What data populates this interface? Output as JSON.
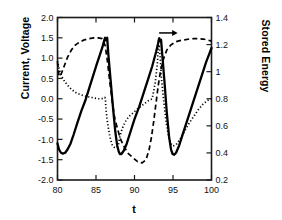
{
  "chart_data": {
    "type": "line",
    "title": "",
    "xlabel": "t",
    "ylabel": "Current, Voltage",
    "y2label": "Stored Energy",
    "xlim": [
      80,
      100
    ],
    "ylim": [
      -2.0,
      2.0
    ],
    "y2lim": [
      0.2,
      1.4
    ],
    "grid": false,
    "legend": "none",
    "xticks": [
      80,
      85,
      90,
      95,
      100
    ],
    "xtick_labels": [
      "80",
      "85",
      "90",
      "95",
      "100"
    ],
    "yticks": [
      -2.0,
      -1.5,
      -1.0,
      -0.5,
      0.0,
      0.5,
      1.0,
      1.5,
      2.0
    ],
    "ytick_labels": [
      "-2.0",
      "-1.5",
      "-1.0",
      "-0.5",
      "0.0",
      "0.5",
      "1.0",
      "1.5",
      "2.0"
    ],
    "y2ticks": [
      0.2,
      0.4,
      0.6,
      0.8,
      1.0,
      1.2,
      1.4
    ],
    "y2tick_labels": [
      "0.2",
      "0.4",
      "0.6",
      "0.8",
      "1",
      "1.2",
      "1.4"
    ],
    "annotations": [
      {
        "name": "right-axis-arrow",
        "text": "",
        "kind": "arrow",
        "x_start": 93.2,
        "y_start": 1.62,
        "x_end": 95.6,
        "y_end": 1.62,
        "points_to": "right axis (Stored Energy)"
      }
    ],
    "series": [
      {
        "name": "current",
        "style": "solid",
        "axis": "left",
        "x": [
          80.0,
          80.2,
          80.45,
          80.7,
          81.0,
          81.3,
          81.7,
          82.1,
          82.6,
          83.1,
          83.6,
          84.1,
          84.6,
          85.1,
          85.5,
          85.8,
          86.0,
          86.1,
          86.18,
          86.25,
          86.3,
          86.45,
          86.6,
          86.9,
          87.2,
          87.5,
          87.75,
          87.95,
          88.1,
          88.3,
          88.6,
          89.0,
          89.5,
          90.0,
          90.6,
          91.2,
          91.8,
          92.3,
          92.8,
          93.05,
          93.15,
          93.22,
          93.3,
          93.45,
          93.6,
          93.9,
          94.2,
          94.5,
          94.75,
          94.95,
          95.15,
          95.4,
          95.8,
          96.3,
          96.9,
          97.5,
          98.1,
          98.7,
          99.3,
          99.7,
          100.0
        ],
        "y": [
          -1.1,
          -1.25,
          -1.33,
          -1.35,
          -1.33,
          -1.25,
          -1.1,
          -0.88,
          -0.58,
          -0.3,
          -0.05,
          0.25,
          0.55,
          0.85,
          1.08,
          1.25,
          1.38,
          1.46,
          1.5,
          1.44,
          1.46,
          1.5,
          1.1,
          0.45,
          -0.2,
          -0.8,
          -1.15,
          -1.3,
          -1.36,
          -1.36,
          -1.28,
          -1.1,
          -0.8,
          -0.5,
          -0.2,
          0.15,
          0.5,
          0.8,
          1.15,
          1.35,
          1.45,
          1.49,
          1.42,
          1.45,
          1.1,
          0.4,
          -0.35,
          -0.95,
          -1.25,
          -1.36,
          -1.38,
          -1.33,
          -1.15,
          -0.85,
          -0.5,
          -0.15,
          0.2,
          0.55,
          0.9,
          1.1,
          1.25
        ]
      },
      {
        "name": "voltage",
        "style": "dashed",
        "axis": "left",
        "x": [
          80.0,
          80.2,
          80.5,
          80.9,
          81.3,
          81.8,
          82.3,
          82.9,
          83.5,
          84.1,
          84.7,
          85.3,
          85.8,
          86.2,
          86.5,
          86.8,
          87.1,
          87.4,
          87.8,
          88.2,
          88.7,
          89.2,
          89.8,
          90.4,
          91.0,
          91.5,
          91.9,
          92.2,
          92.5,
          92.8,
          93.1,
          93.4,
          93.8,
          94.2,
          94.7,
          95.3,
          95.9,
          96.5,
          97.1,
          97.7,
          98.3,
          98.9,
          99.4,
          100.0
        ],
        "y": [
          0.9,
          0.55,
          0.62,
          0.82,
          1.02,
          1.2,
          1.32,
          1.4,
          1.45,
          1.48,
          1.5,
          1.5,
          1.48,
          1.3,
          0.9,
          0.4,
          -0.05,
          -0.45,
          -0.75,
          -1.0,
          -1.2,
          -1.35,
          -1.45,
          -1.55,
          -1.58,
          -1.5,
          -1.25,
          -0.95,
          -0.55,
          -0.1,
          0.35,
          0.7,
          1.0,
          1.2,
          1.32,
          1.4,
          1.43,
          1.45,
          1.47,
          1.48,
          1.48,
          1.47,
          1.45,
          1.42
        ]
      },
      {
        "name": "stored-energy",
        "style": "dotted",
        "axis": "right",
        "x": [
          80.0,
          80.2,
          80.5,
          80.9,
          81.3,
          81.8,
          82.4,
          83.0,
          83.6,
          84.2,
          84.8,
          85.3,
          85.7,
          86.0,
          86.15,
          86.22,
          86.3,
          86.5,
          86.8,
          87.1,
          87.4,
          87.7,
          87.9,
          88.1,
          88.4,
          88.8,
          89.3,
          89.9,
          90.5,
          91.2,
          91.8,
          92.3,
          92.7,
          93.0,
          93.1,
          93.2,
          93.35,
          93.5,
          93.8,
          94.1,
          94.4,
          94.7,
          95.0,
          95.4,
          95.9,
          96.5,
          97.1,
          97.7,
          98.3,
          98.9,
          99.4,
          100.0
        ],
        "y": [
          1.08,
          1.02,
          0.97,
          0.93,
          0.9,
          0.87,
          0.845,
          0.83,
          0.82,
          0.812,
          0.805,
          0.8,
          0.8,
          0.805,
          0.81,
          0.8,
          0.72,
          0.62,
          0.52,
          0.46,
          0.44,
          0.44,
          0.46,
          0.52,
          0.58,
          0.63,
          0.67,
          0.7,
          0.73,
          0.76,
          0.785,
          0.8,
          0.92,
          1.08,
          1.18,
          1.2,
          1.1,
          0.95,
          0.78,
          0.63,
          0.53,
          0.47,
          0.45,
          0.46,
          0.5,
          0.56,
          0.62,
          0.67,
          0.72,
          0.76,
          0.785,
          0.8
        ]
      }
    ]
  },
  "axes": {
    "left_title": "Current, Voltage",
    "right_title": "Stored Energy",
    "x_title": "t"
  }
}
